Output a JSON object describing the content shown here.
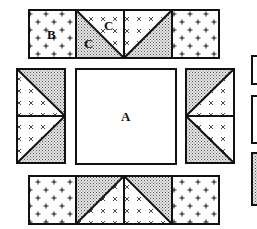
{
  "diagram": {
    "type": "quilt-block-layout",
    "labels": {
      "center": "A",
      "corner_square": "B",
      "triangle_light": "C",
      "triangle_dark": "C"
    },
    "colors": {
      "outline": "#111111",
      "background": "#ffffff",
      "shaded_fill": "#bdbdbd"
    },
    "patterns": {
      "plus": "+",
      "cross": "×"
    },
    "pieces": {
      "center_square": "A",
      "top_strip": [
        "B",
        "C-triangle-pair",
        "C-triangle-pair",
        "B"
      ],
      "bottom_strip": [
        "B",
        "C-triangle-pair",
        "C-triangle-pair",
        "B"
      ],
      "left_strip": [
        "C-triangle-pair",
        "C-triangle-pair"
      ],
      "right_strip": [
        "C-triangle-pair",
        "C-triangle-pair"
      ],
      "legend_swatches": [
        "outline-box",
        "outline-box",
        "shaded-box"
      ]
    }
  }
}
